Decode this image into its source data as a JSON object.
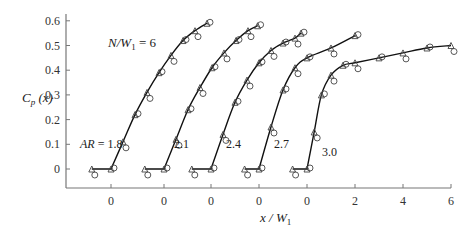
{
  "chart_data": {
    "type": "line",
    "title": "",
    "annotation": "N/W1 = 6",
    "xlabel": "x / W1",
    "ylabel": "Cp (x)",
    "yticks": [
      "0.6",
      "0.5",
      "0.4",
      "0.3",
      "0.2",
      "0.1",
      "0"
    ],
    "xticks": [
      "0",
      "0",
      "0",
      "0",
      "0",
      "2",
      "4",
      "6"
    ],
    "ylim": [
      -0.08,
      0.6
    ],
    "grid": false,
    "legend": "none (curves labeled inline)",
    "series": [
      {
        "name": "AR = 1.8",
        "label": "AR = 1.8",
        "x": [
          -0.8,
          0,
          0.5,
          1,
          1.5,
          2,
          2.5,
          3,
          3.5,
          4
        ],
        "values": [
          0,
          0,
          0.11,
          0.22,
          0.31,
          0.39,
          0.46,
          0.52,
          0.56,
          0.59
        ]
      },
      {
        "name": "AR = 2.1",
        "label": "2.1",
        "x": [
          -0.8,
          0,
          0.5,
          1,
          1.5,
          2,
          2.5,
          3,
          3.5,
          3.9
        ],
        "values": [
          0,
          0,
          0.12,
          0.24,
          0.33,
          0.41,
          0.47,
          0.52,
          0.56,
          0.58
        ]
      },
      {
        "name": "AR = 2.4",
        "label": "2.4",
        "x": [
          -0.8,
          0,
          0.5,
          1,
          1.5,
          2,
          2.5,
          3,
          3.5,
          3.75
        ],
        "values": [
          0,
          0,
          0.14,
          0.27,
          0.36,
          0.43,
          0.48,
          0.51,
          0.53,
          0.55
        ]
      },
      {
        "name": "AR = 2.7",
        "label": "2.7",
        "x": [
          -0.6,
          0,
          0.5,
          1,
          1.5,
          2,
          3,
          4
        ],
        "values": [
          0,
          0,
          0.17,
          0.32,
          0.41,
          0.45,
          0.49,
          0.54
        ]
      },
      {
        "name": "AR = 3.0",
        "label": "3.0",
        "x": [
          -0.6,
          0,
          0.3,
          0.6,
          1,
          1.5,
          2,
          3,
          4,
          5,
          6
        ],
        "values": [
          0,
          0,
          0.15,
          0.3,
          0.38,
          0.42,
          0.43,
          0.45,
          0.47,
          0.49,
          0.5
        ]
      }
    ],
    "markers": [
      "circle",
      "triangle"
    ]
  }
}
